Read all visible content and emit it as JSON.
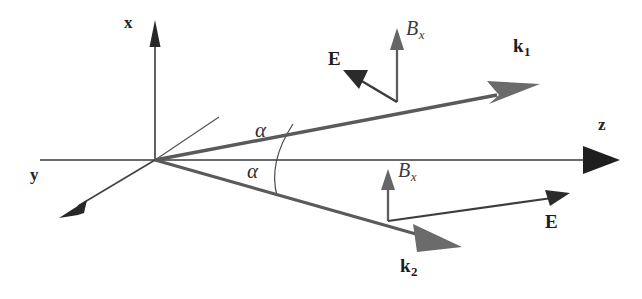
{
  "figure": {
    "background_color": "#ffffff",
    "width": 642,
    "height": 299,
    "colors": {
      "axis": "#333333",
      "ray": "#4a4a4a",
      "arrowhead_gray": "#6b6b6b",
      "arrowhead_dark": "#2b2b2b",
      "thin_line": "#555555",
      "text": "#1c1c1c"
    },
    "axes": [
      {
        "id": "x-axis",
        "label": "x",
        "direction": "up",
        "origin": [
          155,
          160
        ],
        "tip": [
          155,
          22
        ],
        "label_pos": [
          129,
          22
        ],
        "arrowhead": "solid-narrow-dark"
      },
      {
        "id": "y-axis",
        "label": "y",
        "direction": "down-left",
        "origin": [
          155,
          160
        ],
        "tip": [
          62,
          215
        ],
        "label_pos": [
          34,
          175
        ],
        "arrowhead": "solid-narrow-dark"
      },
      {
        "id": "z-axis",
        "label": "z",
        "direction": "right",
        "origin": [
          155,
          160
        ],
        "tip": [
          618,
          160
        ],
        "label_pos": [
          601,
          125
        ],
        "arrowhead": "solid-triangle-dark"
      }
    ],
    "guide_line": {
      "id": "reference-line",
      "from": [
        155,
        160
      ],
      "to": [
        219,
        117
      ],
      "style": "thin",
      "has_arrowhead": false
    },
    "rays": [
      {
        "id": "k1-ray",
        "label": "k",
        "subscript": "1",
        "label_pos": [
          516,
          45
        ],
        "from": [
          155,
          160
        ],
        "to": [
          535,
          88
        ],
        "arrowhead": "slender-gray",
        "angle_label": "α",
        "side": "upper"
      },
      {
        "id": "k2-ray",
        "label": "k",
        "subscript": "2",
        "label_pos": [
          404,
          266
        ],
        "from": [
          155,
          160
        ],
        "to": [
          455,
          243
        ],
        "arrowhead": "wide-gray",
        "angle_label": "α",
        "side": "lower"
      }
    ],
    "angles": [
      {
        "id": "angle-upper",
        "text": "α",
        "pos": [
          262,
          131
        ]
      },
      {
        "id": "angle-lower",
        "text": "α",
        "pos": [
          254,
          170
        ]
      }
    ],
    "field_vectors": [
      {
        "id": "bx-upper",
        "label": "B",
        "subscript": "x",
        "label_pos": [
          408,
          26
        ],
        "from": [
          397,
          102
        ],
        "to": [
          397,
          31
        ],
        "arrowhead": "small-gray",
        "direction": "up"
      },
      {
        "id": "e-upper",
        "label": "E",
        "label_pos": [
          331,
          58
        ],
        "from": [
          397,
          102
        ],
        "to": [
          350,
          72
        ],
        "arrowhead": "small-dark",
        "direction": "up-left"
      },
      {
        "id": "bx-lower",
        "label": "B",
        "subscript": "x",
        "label_pos": [
          400,
          168
        ],
        "from": [
          388,
          221
        ],
        "to": [
          388,
          172
        ],
        "arrowhead": "small-gray",
        "direction": "up"
      },
      {
        "id": "e-lower",
        "label": "E",
        "label_pos": [
          548,
          222
        ],
        "from": [
          388,
          221
        ],
        "to": [
          566,
          195
        ],
        "arrowhead": "small-dark",
        "direction": "up-right"
      }
    ]
  }
}
